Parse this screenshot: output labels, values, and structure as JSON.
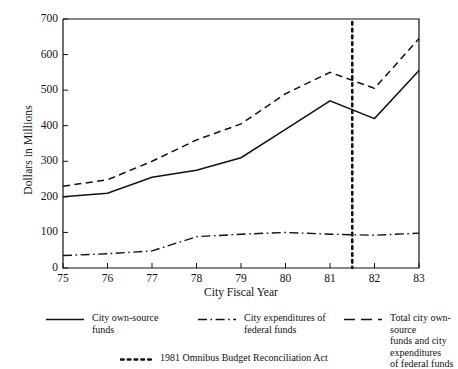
{
  "chart_data": {
    "type": "line",
    "title": "",
    "xlabel": "City Fiscal Year",
    "ylabel": "Dollars in Millions",
    "x": [
      75,
      76,
      77,
      78,
      79,
      80,
      81,
      82,
      83
    ],
    "xtick_labels": [
      "75",
      "76",
      "77",
      "78",
      "79",
      "80",
      "81",
      "82",
      "83"
    ],
    "ytick_labels": [
      "0",
      "100",
      "200",
      "300",
      "400",
      "500",
      "600",
      "700"
    ],
    "xlim": [
      75,
      83
    ],
    "ylim": [
      0,
      700
    ],
    "grid": false,
    "legend_position": "below",
    "series": [
      {
        "name": "City own-source funds",
        "style": "solid",
        "values": [
          200,
          210,
          255,
          275,
          310,
          390,
          470,
          420,
          555
        ]
      },
      {
        "name": "City expenditures of federal funds",
        "style": "dash-dot",
        "values": [
          35,
          40,
          48,
          88,
          95,
          100,
          95,
          92,
          98
        ]
      },
      {
        "name": "Total city own-source funds and city expenditures of federal funds",
        "style": "dashed",
        "values": [
          230,
          248,
          300,
          360,
          405,
          490,
          550,
          505,
          645
        ]
      }
    ],
    "annotations": [
      {
        "name": "1981 Omnibus Budget Reconciliation Act",
        "style": "dotted-vertical",
        "x": 81.5
      }
    ]
  },
  "legend": {
    "entries": [
      {
        "label": "City own-source\nfunds",
        "style": "solid"
      },
      {
        "label": "City expenditures of\n    federal funds",
        "style": "dash-dot"
      },
      {
        "label": "Total city own-source\n   funds and city expenditures\n   of federal funds",
        "style": "dashed"
      }
    ],
    "annotation": {
      "label": "1981 Omnibus Budget Reconciliation Act",
      "style": "dotted"
    }
  },
  "colors": {
    "ink": "#111111",
    "background": "#ffffff"
  }
}
